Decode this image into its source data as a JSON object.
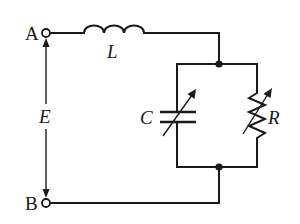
{
  "diagram": {
    "type": "circuit-schematic",
    "terminals": [
      {
        "id": "A",
        "label": "A"
      },
      {
        "id": "B",
        "label": "B"
      }
    ],
    "source": {
      "label": "E",
      "description": "voltage between terminals A and B (double-headed arrow)"
    },
    "components": [
      {
        "id": "L",
        "label": "L",
        "kind": "inductor",
        "connection": "series, top wire from A"
      },
      {
        "id": "C",
        "label": "C",
        "kind": "variable capacitor",
        "connection": "parallel branch (left)"
      },
      {
        "id": "R",
        "label": "R",
        "kind": "variable resistor",
        "connection": "parallel branch (right)"
      }
    ],
    "junctions": 2,
    "colors": {
      "ink": "#1a1a1a",
      "background": "#ffffff"
    }
  },
  "labels": {
    "terminal_a": "A",
    "terminal_b": "B",
    "emf": "E",
    "inductor": "L",
    "capacitor": "C",
    "resistor": "R"
  }
}
